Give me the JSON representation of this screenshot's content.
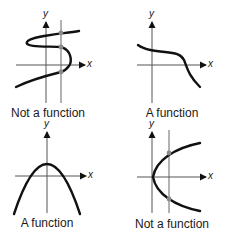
{
  "figure": {
    "panels": [
      {
        "id": "panel-1",
        "caption": "Not a function",
        "x_axis_label": "x",
        "y_axis_label": "y",
        "curve": "S-shaped sideways curve",
        "has_vertical_line_test": true,
        "intersection_points": 3
      },
      {
        "id": "panel-2",
        "caption": "A function",
        "x_axis_label": "x",
        "y_axis_label": "y",
        "curve": "decreasing cubic-like curve",
        "has_vertical_line_test": false,
        "intersection_points": 0
      },
      {
        "id": "panel-3",
        "caption": "A function",
        "x_axis_label": "x",
        "y_axis_label": "y",
        "curve": "downward-opening parabola",
        "has_vertical_line_test": false,
        "intersection_points": 0
      },
      {
        "id": "panel-4",
        "caption": "Not a function",
        "x_axis_label": "x",
        "y_axis_label": "y",
        "curve": "rightward-opening parabola",
        "has_vertical_line_test": true,
        "intersection_points": 2
      }
    ],
    "colors": {
      "curve": "#111111",
      "axis": "#555555",
      "test_line": "#666666",
      "intersection_point": "#8a8a8a"
    }
  }
}
